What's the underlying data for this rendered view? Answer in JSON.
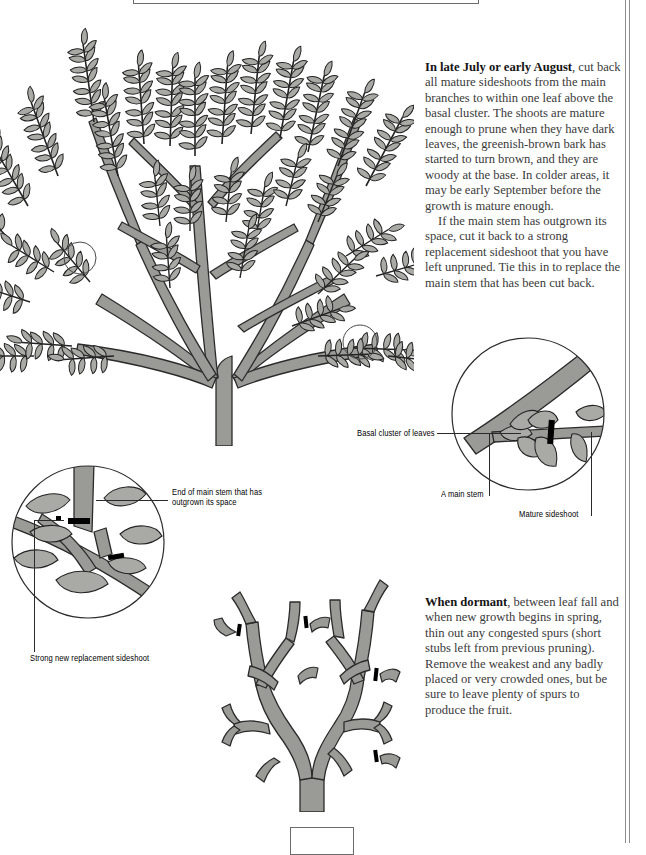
{
  "page": {
    "background": "#ffffff",
    "rule_color": "#8d8d8d",
    "stem_fill": "#9a9a96",
    "stem_stroke": "#2b2b2b",
    "leaf_fill": "#a9a9a5",
    "cut_mark_color": "#000000"
  },
  "text": {
    "harvest": {
      "lead": "In late July or early August",
      "body1": ", cut back all mature sideshoots from the main branches to within one leaf above the basal cluster. The shoots are mature enough to prune when they have dark leaves, the greenish-brown bark has started to turn brown, and they are woody at the base. In colder areas, it may be early September before the growth is mature enough.",
      "body2": "If the main stem has outgrown its space, cut it back to a strong replacement sideshoot that you have left unpruned. Tie this in to replace the main stem that has been cut back."
    },
    "dormant": {
      "lead": "When dormant",
      "body1": ", between leaf fall and when new growth begins in spring, thin out any congested spurs (short stubs left from previous pruning). Remove the weakest and any badly placed or very crowded ones, but be sure to leave plenty of spurs to produce the fruit."
    }
  },
  "labels": {
    "end_of_main_stem": "End of main stem that has\noutgrown its space",
    "strong_new_replacement": "Strong new replacement sideshoot",
    "basal_cluster": "Basal cluster  of leaves",
    "a_main_stem": "A main stem",
    "mature_sideshoot": "Mature sideshoot"
  },
  "figures": {
    "fan_tree": "fan-trained-fruit-tree-in-leaf",
    "detail_left": "detail-circle-replacement-sideshoot",
    "detail_right": "detail-circle-basal-cluster-cut",
    "dormant_branch": "dormant-branch-with-spurs"
  }
}
